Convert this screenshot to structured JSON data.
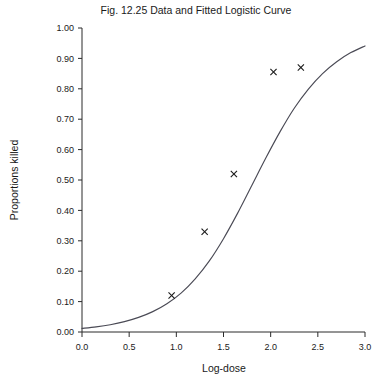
{
  "chart_data": {
    "type": "scatter",
    "title": "Fig. 12.25 Data and Fitted Logistic Curve",
    "xlabel": "Log-dose",
    "ylabel": "Proportions killed",
    "xlim": [
      0.0,
      3.0
    ],
    "ylim": [
      0.0,
      1.0
    ],
    "grid": false,
    "legend": "none",
    "xticks": [
      "0.0",
      "0.5",
      "1.0",
      "1.5",
      "2.0",
      "2.5",
      "3.0"
    ],
    "xtick_values": [
      0.0,
      0.5,
      1.0,
      1.5,
      2.0,
      2.5,
      3.0
    ],
    "yticks": [
      "0.00",
      "0.10",
      "0.20",
      "0.30",
      "0.40",
      "0.50",
      "0.60",
      "0.70",
      "0.80",
      "0.90",
      "1.00"
    ],
    "ytick_values": [
      0.0,
      0.1,
      0.2,
      0.3,
      0.4,
      0.5,
      0.6,
      0.7,
      0.8,
      0.9,
      1.0
    ],
    "series": [
      {
        "name": "Observed data",
        "marker": "x",
        "x": [
          0.95,
          1.3,
          1.61,
          2.03,
          2.32
        ],
        "values": [
          0.12,
          0.33,
          0.52,
          0.855,
          0.87
        ]
      },
      {
        "name": "Fitted logistic curve",
        "marker": "line",
        "x": [
          0.0,
          0.15,
          0.3,
          0.45,
          0.6,
          0.75,
          0.9,
          1.05,
          1.2,
          1.35,
          1.5,
          1.65,
          1.8,
          1.95,
          2.1,
          2.25,
          2.4,
          2.55,
          2.7,
          2.85,
          3.0
        ],
        "values": [
          0.012,
          0.017,
          0.024,
          0.034,
          0.048,
          0.067,
          0.093,
          0.128,
          0.175,
          0.234,
          0.307,
          0.391,
          0.482,
          0.573,
          0.659,
          0.736,
          0.799,
          0.85,
          0.889,
          0.919,
          0.941
        ]
      }
    ]
  },
  "colors": {
    "axis": "#2b2b2b",
    "curve": "#4a4a55",
    "marker": "#1a1a1a",
    "background": "#ffffff"
  }
}
